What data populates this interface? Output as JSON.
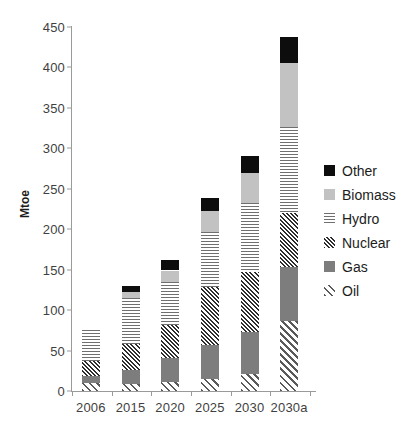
{
  "chart_data": {
    "type": "bar",
    "subtype": "stacked",
    "title": "",
    "xlabel": "",
    "ylabel": "Mtoe",
    "ylim": [
      0,
      450
    ],
    "ytick_step": 50,
    "yticks": [
      0,
      50,
      100,
      150,
      200,
      250,
      300,
      350,
      400,
      450
    ],
    "categories": [
      "2006",
      "2015",
      "2020",
      "2025",
      "2030",
      "2030a"
    ],
    "grid": false,
    "legend_position": "right",
    "legend_order_top_to_bottom": [
      "Other",
      "Biomass",
      "Hydro",
      "Nuclear",
      "Gas",
      "Oil"
    ],
    "series": [
      {
        "name": "Oil",
        "pattern": "diagonal-hatch",
        "color": "#5a5a5a",
        "values": [
          10,
          9,
          11,
          15,
          21,
          86
        ]
      },
      {
        "name": "Gas",
        "pattern": "solid-medium-gray",
        "color": "#7d7d7d",
        "values": [
          8,
          17,
          30,
          42,
          52,
          67
        ]
      },
      {
        "name": "Nuclear",
        "pattern": "diagonal-crosshatch",
        "color": "#2e2e2e",
        "values": [
          19,
          32,
          41,
          72,
          74,
          67
        ]
      },
      {
        "name": "Hydro",
        "pattern": "horizontal-lines",
        "color": "#6f6f6f",
        "values": [
          38,
          57,
          53,
          67,
          85,
          107
        ]
      },
      {
        "name": "Biomass",
        "pattern": "solid-light-gray",
        "color": "#c2c2c2",
        "values": [
          0,
          8,
          14,
          26,
          38,
          78
        ]
      },
      {
        "name": "Other",
        "pattern": "solid-black",
        "color": "#0d0d0d",
        "values": [
          0,
          7,
          13,
          17,
          20,
          33
        ]
      }
    ],
    "totals": [
      75,
      130,
      162,
      239,
      290,
      438
    ],
    "stack_tops": [
      75,
      159,
      194,
      238,
      290,
      415
    ]
  },
  "legend": {
    "items": [
      {
        "label": "Other",
        "swatch": "swatch-other-solid-black"
      },
      {
        "label": "Biomass",
        "swatch": "swatch-biomass-light-gray"
      },
      {
        "label": "Hydro",
        "swatch": "swatch-hydro-horizontal-lines"
      },
      {
        "label": "Nuclear",
        "swatch": "swatch-nuclear-crosshatch"
      },
      {
        "label": "Gas",
        "swatch": "swatch-gas-medium-gray"
      },
      {
        "label": "Oil",
        "swatch": "swatch-oil-diagonal-hatch"
      }
    ]
  },
  "colors": {
    "other": "#0d0d0d",
    "biomass": "#c2c2c2",
    "hydro": "#6f6f6f",
    "nuclear": "#2e2e2e",
    "gas": "#7d7d7d",
    "oil": "#5a5a5a",
    "axis": "#9a9a9a",
    "text": "#3f3f3f",
    "background": "#ffffff"
  }
}
